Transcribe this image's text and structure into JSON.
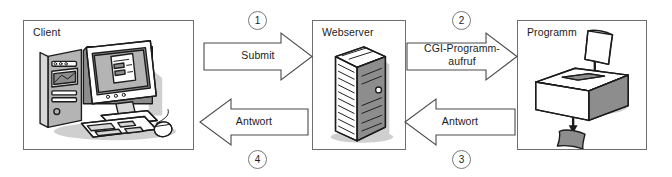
{
  "diagram": {
    "title_visible": false,
    "nodes": [
      {
        "id": "client",
        "label": "Client",
        "icon": "desktop-computer-illustration"
      },
      {
        "id": "webserver",
        "label": "Webserver",
        "icon": "server-tower-illustration"
      },
      {
        "id": "programm",
        "label": "Programm",
        "icon": "box-with-paper-illustration"
      }
    ],
    "flows": [
      {
        "id": "submit",
        "label": "Submit",
        "direction": "right",
        "step": "1",
        "from": "client",
        "to": "webserver"
      },
      {
        "id": "answer-1",
        "label": "Antwort",
        "direction": "left",
        "step": "4",
        "from": "webserver",
        "to": "client"
      },
      {
        "id": "cgi-call",
        "label": "CGI-Programm-\naufruf",
        "direction": "right",
        "step": "2",
        "from": "webserver",
        "to": "programm"
      },
      {
        "id": "answer-2",
        "label": "Antwort",
        "direction": "left",
        "step": "3",
        "from": "programm",
        "to": "webserver"
      }
    ],
    "flow_labels": {
      "submit": "Submit",
      "answer_1": "Antwort",
      "cgi_line1": "CGI-Programm-",
      "cgi_line2": "aufruf",
      "answer_2": "Antwort"
    },
    "steps": {
      "one": "1",
      "two": "2",
      "three": "3",
      "four": "4"
    },
    "colors": {
      "ink": "#1c1c1c",
      "box_border": "#6e6e6e",
      "arrow_stroke": "#4a4a4a",
      "background": "#ffffff",
      "shade_light": "#d8d8d8",
      "shade_mid": "#b4b4b4",
      "shade_dark": "#8d8d8d"
    }
  }
}
